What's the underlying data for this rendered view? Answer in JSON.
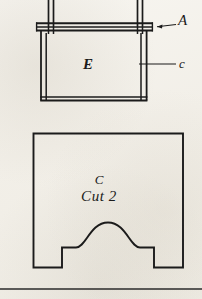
{
  "page": {
    "width": 202,
    "height": 299,
    "paper_color": "#f4f2ec",
    "ink_color": "#1b1b1b",
    "caption": ""
  },
  "figures": {
    "upper": {
      "name": "elevation-view",
      "description": "Elevation detail showing two vertical legs, a horizontal rail, and a panel",
      "labels": {
        "rail": "A",
        "side": "c",
        "panel": "E"
      }
    },
    "lower": {
      "name": "plan-view",
      "description": "Panel outline with arched cutout and notched feet",
      "labels": {
        "part": "C",
        "instruction": "Cut 2"
      }
    }
  },
  "geometry": {
    "upper": {
      "leg_left_x": 48,
      "leg_right_x": 137,
      "leg_top_y": 0,
      "rail_top_y": 22,
      "rail_bottom_y": 31,
      "rail_left_x": 36,
      "rail_right_x": 152,
      "panel_left_x": 40,
      "panel_right_x": 147,
      "panel_top_y": 31,
      "panel_bottom_y": 100
    },
    "lower": {
      "left_x": 33,
      "right_x": 183,
      "top_y": 133,
      "bottom_y": 268,
      "notch_left_x": 62,
      "notch_right_x": 154,
      "notch_y": 248,
      "arch_left_x": 78,
      "arch_right_x": 138,
      "arch_peak_y": 222
    },
    "rule_y": 289
  },
  "leaders": {
    "A": {
      "from_x": 176,
      "from_y": 24,
      "to_x": 155,
      "to_y": 27
    },
    "c": {
      "from_x": 176,
      "from_y": 64,
      "to_x": 148,
      "to_y": 64
    }
  }
}
